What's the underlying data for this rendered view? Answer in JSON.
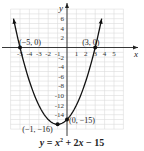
{
  "chart_data": {
    "type": "line",
    "equation": "y = x² + 2x − 15",
    "xlabel": "x",
    "ylabel": "y",
    "xlim": [
      -6,
      7
    ],
    "ylim": [
      -17,
      8
    ],
    "grid": true,
    "x_ticks": [
      -5,
      -4,
      -3,
      -2,
      -1,
      1,
      2,
      3,
      4,
      5
    ],
    "x_tick_labels": [
      "-5",
      "-4",
      "-3",
      "-2",
      "-1",
      "1",
      "2",
      "3",
      "4",
      "5"
    ],
    "y_ticks": [
      6,
      4,
      2,
      -2,
      -4,
      -6,
      -8,
      -10,
      -12,
      -14
    ],
    "y_tick_labels": [
      "6",
      "4",
      "2",
      "-2",
      "-4",
      "-6",
      "-8",
      "-10",
      "-12",
      "-14"
    ],
    "series": [
      {
        "name": "y = x^2 + 2x - 15",
        "function": "x^2 + 2x - 15",
        "x_range": [
          -5.69,
          3.69
        ],
        "color": "#111111"
      }
    ],
    "points": [
      {
        "x": -5,
        "y": 0,
        "label": "(−5, 0)"
      },
      {
        "x": 3,
        "y": 0,
        "label": "(3, 0)"
      },
      {
        "x": 0,
        "y": -15,
        "label": "(0, −15)"
      },
      {
        "x": -1,
        "y": -16,
        "label": "(−1, −16)"
      }
    ]
  },
  "caption": {
    "y": "y",
    "eq": " = ",
    "x2": "x",
    "sup": "2",
    "rest1": " + 2",
    "x": "x",
    "rest2": " − 15"
  },
  "axes": {
    "x_label": "x",
    "y_label": "y"
  }
}
